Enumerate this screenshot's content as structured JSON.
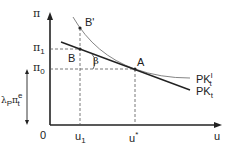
{
  "diagram": {
    "y_axis_label": "π",
    "x_axis_label": "u",
    "origin_label": "0",
    "y_ticks": [
      {
        "name": "pi1",
        "base": "π",
        "sub": "1"
      },
      {
        "name": "pi0",
        "base": "π",
        "sub": "0"
      }
    ],
    "x_ticks": [
      {
        "name": "u1",
        "base": "u",
        "sub": "1"
      },
      {
        "name": "ustar",
        "base": "u",
        "sup": "*"
      }
    ],
    "points": {
      "A": "A",
      "B": "B",
      "B_prime": "B'"
    },
    "angle_label": "β",
    "bracket_label": {
      "prefix": "λ",
      "prefix_sub": "P",
      "base": "π",
      "sup": "e",
      "sub": "t"
    },
    "curves": {
      "long_run": {
        "base": "PK",
        "sup": "l",
        "sub": "t"
      },
      "short_run": {
        "base": "PK",
        "sub": "t"
      }
    },
    "colors": {
      "axis": "#222222",
      "line": "#222222",
      "curve": "#777777",
      "dash": "#555555"
    }
  }
}
